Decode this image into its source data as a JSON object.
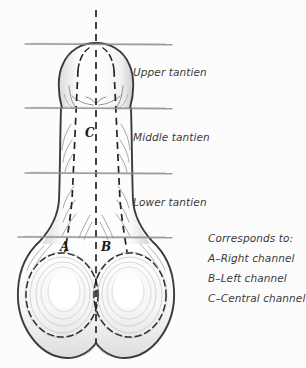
{
  "diagram": {
    "title_labels": [
      {
        "id": "upper",
        "text": "Upper tantien",
        "x": 133,
        "y": 72
      },
      {
        "id": "middle",
        "text": "Middle tantien",
        "x": 133,
        "y": 137
      },
      {
        "id": "lower",
        "text": "Lower tantien",
        "x": 133,
        "y": 202
      }
    ],
    "markers": [
      {
        "id": "a",
        "text": "A",
        "x": 62,
        "y": 240
      },
      {
        "id": "b",
        "text": "B",
        "x": 102,
        "y": 240
      },
      {
        "id": "c",
        "text": "C",
        "x": 85,
        "y": 126
      }
    ],
    "legend": {
      "heading": "Corresponds to:",
      "items": [
        "A–Right channel",
        "B–Left channel",
        "C–Central channel"
      ]
    },
    "colors": {
      "background": "#fcfcfc",
      "outline": "#3b3b3b",
      "dashed_channel": "#2a2a2a",
      "divider_line": "#8d8d8d",
      "shading": "#b9b9b9",
      "text": "#3a3a3a"
    },
    "divider_lines": [
      {
        "id": "divider-1",
        "y": 44,
        "x1": 25,
        "x2": 172
      },
      {
        "id": "divider-2",
        "y": 108,
        "x1": 25,
        "x2": 172
      },
      {
        "id": "divider-3",
        "y": 173,
        "x1": 25,
        "x2": 172
      },
      {
        "id": "divider-4",
        "y": 237,
        "x1": 18,
        "x2": 172
      }
    ]
  }
}
